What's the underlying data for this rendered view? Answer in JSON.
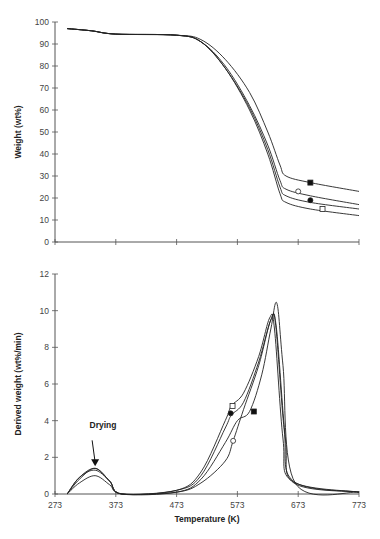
{
  "chart_data": [
    {
      "type": "line",
      "title": "",
      "xlabel": "",
      "ylabel": "Weight (wt%)",
      "xlim": [
        273,
        773
      ],
      "ylim": [
        0,
        100
      ],
      "xticks": [
        273,
        373,
        473,
        573,
        673,
        773
      ],
      "yticks": [
        0,
        10,
        20,
        30,
        40,
        50,
        60,
        70,
        80,
        90,
        100
      ],
      "grid": false,
      "series": [
        {
          "name": "filled-square",
          "marker": "square-filled",
          "x": [
            293,
            333,
            373,
            473,
            513,
            553,
            593,
            623,
            643,
            653,
            693,
            773
          ],
          "y": [
            97,
            96,
            94.5,
            94,
            92,
            83,
            68,
            50,
            35,
            30,
            27,
            23
          ]
        },
        {
          "name": "open-circle",
          "marker": "circle-open",
          "x": [
            293,
            333,
            373,
            473,
            513,
            553,
            593,
            623,
            643,
            653,
            693,
            773
          ],
          "y": [
            97,
            96,
            94.5,
            94,
            91,
            80,
            62,
            44,
            28,
            24,
            21,
            17
          ]
        },
        {
          "name": "filled-circle",
          "marker": "circle-filled",
          "x": [
            293,
            333,
            373,
            473,
            513,
            553,
            593,
            623,
            643,
            653,
            693,
            773
          ],
          "y": [
            97,
            96,
            94.5,
            94,
            91,
            79,
            61,
            42,
            25,
            21,
            18,
            15
          ]
        },
        {
          "name": "open-square",
          "marker": "square-open",
          "x": [
            293,
            333,
            373,
            473,
            513,
            553,
            593,
            623,
            643,
            653,
            693,
            773
          ],
          "y": [
            97,
            96,
            94.5,
            94,
            91,
            79,
            60,
            40,
            22,
            18,
            15,
            12
          ]
        }
      ],
      "markers": [
        {
          "series": "filled-square",
          "x": 693,
          "y": 27
        },
        {
          "series": "open-circle",
          "x": 673,
          "y": 23
        },
        {
          "series": "filled-circle",
          "x": 693,
          "y": 19
        },
        {
          "series": "open-square",
          "x": 713,
          "y": 15
        }
      ]
    },
    {
      "type": "line",
      "title": "",
      "xlabel": "Temperature (K)",
      "ylabel": "Derived weight (wt%/min)",
      "xlim": [
        273,
        773
      ],
      "ylim": [
        0,
        12
      ],
      "xticks": [
        273,
        373,
        473,
        573,
        673,
        773
      ],
      "yticks": [
        0,
        2,
        4,
        6,
        8,
        10,
        12
      ],
      "grid": false,
      "annotations": [
        {
          "text": "Drying",
          "x": 339,
          "y": 1.4,
          "arrow": true
        }
      ],
      "series": [
        {
          "name": "filled-square",
          "marker": "square-filled",
          "x": [
            293,
            313,
            339,
            363,
            383,
            473,
            513,
            553,
            573,
            593,
            613,
            628,
            638,
            648,
            668,
            773
          ],
          "y": [
            0,
            0.8,
            1.4,
            0.7,
            0,
            0.1,
            0.8,
            2.8,
            4.0,
            4.5,
            6.5,
            9.0,
            10.4,
            7.0,
            0.6,
            0.1
          ]
        },
        {
          "name": "open-square",
          "marker": "square-open",
          "x": [
            293,
            313,
            339,
            363,
            383,
            473,
            513,
            553,
            563,
            583,
            608,
            626,
            634,
            648,
            663,
            773
          ],
          "y": [
            0,
            0.9,
            1.4,
            0.7,
            0,
            0.2,
            1.2,
            4.0,
            4.8,
            5.5,
            7.5,
            9.6,
            9.0,
            3.0,
            0.7,
            0.1
          ]
        },
        {
          "name": "filled-circle",
          "marker": "circle-filled",
          "x": [
            293,
            313,
            339,
            363,
            383,
            473,
            513,
            553,
            563,
            583,
            608,
            628,
            636,
            650,
            665,
            773
          ],
          "y": [
            0,
            0.9,
            1.3,
            0.7,
            0,
            0.2,
            1.0,
            3.6,
            4.3,
            5.0,
            7.2,
            9.5,
            9.2,
            3.5,
            0.7,
            0.1
          ]
        },
        {
          "name": "open-circle",
          "marker": "circle-open",
          "x": [
            293,
            313,
            339,
            363,
            383,
            473,
            513,
            553,
            566,
            583,
            608,
            628,
            637,
            652,
            666,
            773
          ],
          "y": [
            0,
            0.6,
            1.0,
            0.5,
            0,
            0.1,
            0.6,
            1.8,
            2.9,
            4.6,
            7.0,
            9.5,
            9.1,
            3.0,
            0.6,
            0.1
          ]
        }
      ],
      "markers": [
        {
          "series": "open-square",
          "x": 565,
          "y": 4.8
        },
        {
          "series": "filled-circle",
          "x": 562,
          "y": 4.4
        },
        {
          "series": "filled-square",
          "x": 600,
          "y": 4.5
        },
        {
          "series": "open-circle",
          "x": 566,
          "y": 2.9
        }
      ]
    }
  ],
  "labels": {
    "top_ylabel": "Weight (wt%)",
    "bottom_ylabel": "Derived weight (wt%/min)",
    "xlabel": "Temperature (K)",
    "drying": "Drying"
  }
}
